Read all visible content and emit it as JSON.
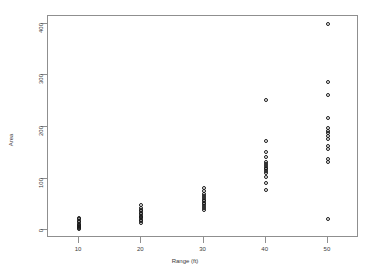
{
  "chart_data": {
    "type": "scatter",
    "title": "",
    "xlabel": "Range (ft)",
    "ylabel": "Area",
    "xlim": [
      5,
      55
    ],
    "ylim": [
      -15,
      415
    ],
    "xticks": [
      10,
      20,
      30,
      40,
      50
    ],
    "yticks": [
      0,
      100,
      200,
      300,
      400
    ],
    "grid": false,
    "legend": null,
    "marker": "open-circle",
    "marker_color": "#1a1a1a",
    "points": [
      {
        "x": 10,
        "y": 2
      },
      {
        "x": 10,
        "y": 5
      },
      {
        "x": 10,
        "y": 7
      },
      {
        "x": 10,
        "y": 9
      },
      {
        "x": 10,
        "y": 11
      },
      {
        "x": 10,
        "y": 13
      },
      {
        "x": 10,
        "y": 16
      },
      {
        "x": 10,
        "y": 18
      },
      {
        "x": 10,
        "y": 21
      },
      {
        "x": 10,
        "y": 24
      },
      {
        "x": 20,
        "y": 14
      },
      {
        "x": 20,
        "y": 17
      },
      {
        "x": 20,
        "y": 20
      },
      {
        "x": 20,
        "y": 23
      },
      {
        "x": 20,
        "y": 26
      },
      {
        "x": 20,
        "y": 28
      },
      {
        "x": 20,
        "y": 31
      },
      {
        "x": 20,
        "y": 34
      },
      {
        "x": 20,
        "y": 37
      },
      {
        "x": 20,
        "y": 40
      },
      {
        "x": 20,
        "y": 44
      },
      {
        "x": 20,
        "y": 48
      },
      {
        "x": 30,
        "y": 40
      },
      {
        "x": 30,
        "y": 44
      },
      {
        "x": 30,
        "y": 47
      },
      {
        "x": 30,
        "y": 50
      },
      {
        "x": 30,
        "y": 53
      },
      {
        "x": 30,
        "y": 56
      },
      {
        "x": 30,
        "y": 59
      },
      {
        "x": 30,
        "y": 62
      },
      {
        "x": 30,
        "y": 66
      },
      {
        "x": 30,
        "y": 70
      },
      {
        "x": 30,
        "y": 76
      },
      {
        "x": 30,
        "y": 82
      },
      {
        "x": 40,
        "y": 78
      },
      {
        "x": 40,
        "y": 92
      },
      {
        "x": 40,
        "y": 104
      },
      {
        "x": 40,
        "y": 110
      },
      {
        "x": 40,
        "y": 114
      },
      {
        "x": 40,
        "y": 118
      },
      {
        "x": 40,
        "y": 121
      },
      {
        "x": 40,
        "y": 124
      },
      {
        "x": 40,
        "y": 128
      },
      {
        "x": 40,
        "y": 133
      },
      {
        "x": 40,
        "y": 141
      },
      {
        "x": 40,
        "y": 152
      },
      {
        "x": 40,
        "y": 172
      },
      {
        "x": 40,
        "y": 252
      },
      {
        "x": 50,
        "y": 22
      },
      {
        "x": 50,
        "y": 132
      },
      {
        "x": 50,
        "y": 138
      },
      {
        "x": 50,
        "y": 158
      },
      {
        "x": 50,
        "y": 163
      },
      {
        "x": 50,
        "y": 176
      },
      {
        "x": 50,
        "y": 183
      },
      {
        "x": 50,
        "y": 188
      },
      {
        "x": 50,
        "y": 193
      },
      {
        "x": 50,
        "y": 199
      },
      {
        "x": 50,
        "y": 218
      },
      {
        "x": 50,
        "y": 262
      },
      {
        "x": 50,
        "y": 288
      },
      {
        "x": 50,
        "y": 400
      }
    ]
  }
}
